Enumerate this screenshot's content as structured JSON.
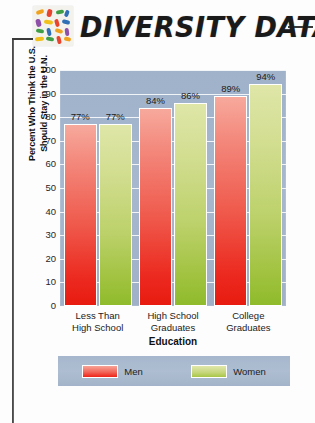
{
  "header": {
    "title": "DIVERSITY DATA",
    "logo_icon": "colored-pills-grid-logo"
  },
  "chart_data": {
    "type": "bar",
    "title": "",
    "categories": [
      "Less Than High School",
      "High School Graduates",
      "College Graduates"
    ],
    "category_lines": [
      [
        "Less Than",
        "High School"
      ],
      [
        "High School",
        "Graduates"
      ],
      [
        "College",
        "Graduates"
      ]
    ],
    "series": [
      {
        "name": "Men",
        "values": [
          77,
          84,
          89
        ],
        "color": "#ee2317"
      },
      {
        "name": "Women",
        "values": [
          77,
          86,
          94
        ],
        "color": "#a9c747"
      }
    ],
    "value_labels": [
      [
        "77%",
        "77%"
      ],
      [
        "84%",
        "86%"
      ],
      [
        "89%",
        "94%"
      ]
    ],
    "xlabel": "Education",
    "ylabel": "Percent Who Think the U.S. Should Stay in the U.N.",
    "ylabel_lines": [
      "Percent Who Think the U.S.",
      "Should Stay in the U.N."
    ],
    "ylim": [
      0,
      100
    ],
    "yticks": [
      100,
      90,
      80,
      70,
      60,
      50,
      40,
      30,
      20,
      10,
      0
    ],
    "grid": true,
    "legend_position": "bottom",
    "plot_background": "#a4b5cc"
  }
}
